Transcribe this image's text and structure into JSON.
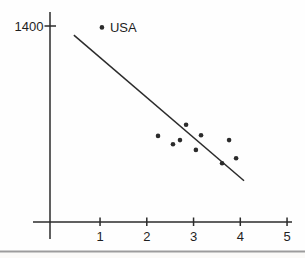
{
  "figure": {
    "background": "#fefefe",
    "ink_color": "#2b2b2b",
    "text_color": "#1f1f1f",
    "separator_color": "#9c9c9c",
    "footer_bg": "#fbfaf8"
  },
  "chart_data": {
    "type": "scatter",
    "title": "",
    "xlabel": "",
    "ylabel": "",
    "grid": false,
    "legend": null,
    "xlim": [
      0,
      5.4
    ],
    "ylim": [
      0,
      1500
    ],
    "x_ticks": [
      1,
      2,
      3,
      4,
      5
    ],
    "x_tick_labels": [
      "1",
      "2",
      "3",
      "4",
      "5"
    ],
    "y_ticks": [
      1400
    ],
    "y_tick_labels": [
      "1400"
    ],
    "annotations": [
      {
        "text": "USA",
        "attached_to_point": true
      }
    ],
    "points": [
      {
        "x": 1.04,
        "y": 1390,
        "label": "USA"
      },
      {
        "x": 2.24,
        "y": 615,
        "label": ""
      },
      {
        "x": 2.56,
        "y": 555,
        "label": ""
      },
      {
        "x": 2.71,
        "y": 585,
        "label": ""
      },
      {
        "x": 2.84,
        "y": 695,
        "label": ""
      },
      {
        "x": 3.05,
        "y": 515,
        "label": ""
      },
      {
        "x": 3.16,
        "y": 620,
        "label": ""
      },
      {
        "x": 3.61,
        "y": 420,
        "label": ""
      },
      {
        "x": 3.76,
        "y": 585,
        "label": ""
      },
      {
        "x": 3.91,
        "y": 455,
        "label": ""
      }
    ],
    "trendline": {
      "x1": 0.44,
      "y1": 1335,
      "x2": 4.08,
      "y2": 295
    }
  }
}
